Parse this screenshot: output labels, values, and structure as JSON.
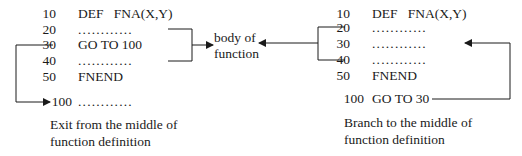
{
  "left_program": {
    "lines": [
      {
        "num": "10",
        "code": "DEF   FNA(X,Y)"
      },
      {
        "num": "20",
        "code": "............"
      },
      {
        "num": "30",
        "code": "GO TO 100"
      },
      {
        "num": "40",
        "code": "............"
      },
      {
        "num": "50",
        "code": "FNEND"
      },
      {
        "num": "100",
        "code": "............"
      }
    ],
    "caption_line1": "Exit from the middle of",
    "caption_line2": "function definition"
  },
  "center_label": {
    "line1": "body of",
    "line2": "function"
  },
  "right_program": {
    "lines": [
      {
        "num": "10",
        "code": "DEF   FNA(X,Y)"
      },
      {
        "num": "20",
        "code": "............"
      },
      {
        "num": "30",
        "code": "............"
      },
      {
        "num": "40",
        "code": "............"
      },
      {
        "num": "50",
        "code": "FNEND"
      },
      {
        "num": "100",
        "code": "GO TO 30"
      }
    ],
    "caption_line1": "Branch to the middle of",
    "caption_line2": "function definition"
  },
  "colors": {
    "ink": "#1a1a1a",
    "background": "#ffffff"
  }
}
